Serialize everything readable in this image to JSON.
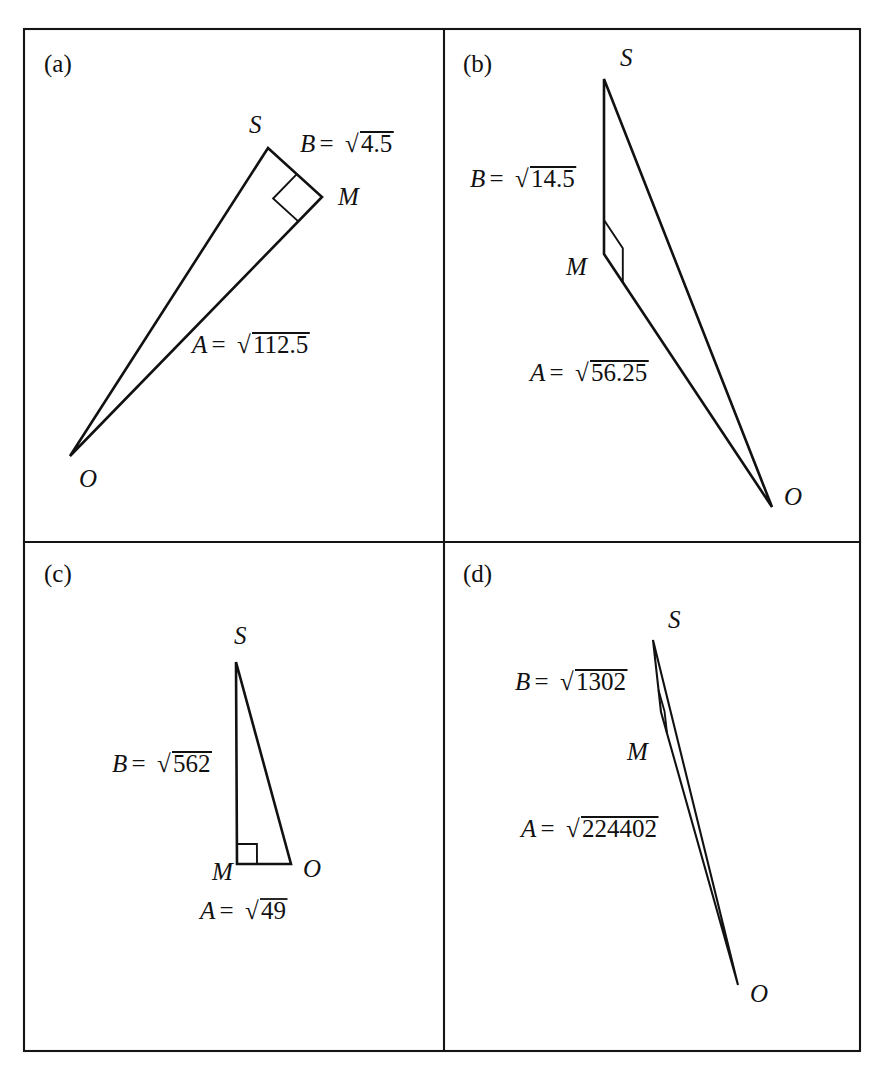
{
  "figure": {
    "background_color": "#ffffff",
    "ink_color": "#111111",
    "frame": {
      "left": 24,
      "top": 29,
      "right": 860,
      "bottom": 1051,
      "vertical_divider_x": 444,
      "horizontal_divider_y": 542
    },
    "panels": [
      {
        "id": "a",
        "tag": "(a)",
        "tag_x": 44,
        "tag_y": 72,
        "vertices": {
          "S": {
            "x": 268,
            "y": 148,
            "label": "S",
            "label_x": 249,
            "label_y": 133
          },
          "M": {
            "x": 322,
            "y": 197,
            "label": "M",
            "label_x": 338,
            "label_y": 205
          },
          "O": {
            "x": 70,
            "y": 456,
            "label": "O",
            "label_x": 79,
            "label_y": 487
          }
        },
        "right_angle_at": "M",
        "right_angle_size": 34,
        "labels": [
          {
            "name": "hypotenuse-label-B",
            "var": "B",
            "eq": "=",
            "radicand": "4.5",
            "text": "B = √4.5",
            "x": 300,
            "y": 152
          },
          {
            "name": "leg-label-A",
            "var": "A",
            "eq": "=",
            "radicand": "112.5",
            "text": "A = √112.5",
            "x": 192,
            "y": 353
          }
        ]
      },
      {
        "id": "b",
        "tag": "(b)",
        "tag_x": 463,
        "tag_y": 72,
        "vertices": {
          "S": {
            "x": 604,
            "y": 79,
            "label": "S",
            "label_x": 620,
            "label_y": 66
          },
          "M": {
            "x": 604,
            "y": 254,
            "label": "M",
            "label_x": 566,
            "label_y": 275
          },
          "O": {
            "x": 772,
            "y": 507,
            "label": "O",
            "label_x": 784,
            "label_y": 505
          }
        },
        "right_angle_at": "M",
        "right_angle_size": 34,
        "labels": [
          {
            "name": "hypotenuse-label-B",
            "var": "B",
            "eq": "=",
            "radicand": "14.5",
            "text": "B = √14.5",
            "x": 470,
            "y": 187
          },
          {
            "name": "leg-label-A",
            "var": "A",
            "eq": "=",
            "radicand": "56.25",
            "text": "A = √56.25",
            "x": 530,
            "y": 381
          }
        ]
      },
      {
        "id": "c",
        "tag": "(c)",
        "tag_x": 44,
        "tag_y": 582,
        "vertices": {
          "S": {
            "x": 236,
            "y": 662,
            "label": "S",
            "label_x": 234,
            "label_y": 644
          },
          "M": {
            "x": 237,
            "y": 864,
            "label": "M",
            "label_x": 212,
            "label_y": 880
          },
          "O": {
            "x": 291,
            "y": 864,
            "label": "O",
            "label_x": 303,
            "label_y": 877
          }
        },
        "right_angle_at": "M",
        "right_angle_size": 20,
        "labels": [
          {
            "name": "hypotenuse-label-B",
            "var": "B",
            "eq": "=",
            "radicand": "562",
            "text": "B = √562",
            "x": 112,
            "y": 772
          },
          {
            "name": "leg-label-A",
            "var": "A",
            "eq": "=",
            "radicand": "49",
            "text": "A = √49",
            "x": 200,
            "y": 919
          }
        ]
      },
      {
        "id": "d",
        "tag": "(d)",
        "tag_x": 463,
        "tag_y": 582,
        "vertices": {
          "S": {
            "x": 653,
            "y": 640,
            "label": "S",
            "label_x": 668,
            "label_y": 628
          },
          "M": {
            "x": 661,
            "y": 712,
            "label": "M",
            "label_x": 627,
            "label_y": 760
          },
          "O": {
            "x": 738,
            "y": 985,
            "label": "O",
            "label_x": 750,
            "label_y": 1002
          }
        },
        "right_angle_at": "M",
        "right_angle_size": 22,
        "labels": [
          {
            "name": "hypotenuse-label-B",
            "var": "B",
            "eq": "=",
            "radicand": "1302",
            "text": "B = √1302",
            "x": 515,
            "y": 690
          },
          {
            "name": "leg-label-A",
            "var": "A",
            "eq": "=",
            "radicand": "224402",
            "text": "A = √224402",
            "x": 521,
            "y": 837
          }
        ]
      }
    ]
  },
  "chart_data": {
    "type": "diagram",
    "panels": [
      {
        "id": "a",
        "A": "sqrt(112.5)",
        "B": "sqrt(4.5)",
        "A_value": 112.5,
        "B_value": 4.5
      },
      {
        "id": "b",
        "A": "sqrt(56.25)",
        "B": "sqrt(14.5)",
        "A_value": 56.25,
        "B_value": 14.5
      },
      {
        "id": "c",
        "A": "sqrt(49)",
        "B": "sqrt(562)",
        "A_value": 49,
        "B_value": 562
      },
      {
        "id": "d",
        "A": "sqrt(224402)",
        "B": "sqrt(1302)",
        "A_value": 224402,
        "B_value": 1302
      }
    ]
  }
}
